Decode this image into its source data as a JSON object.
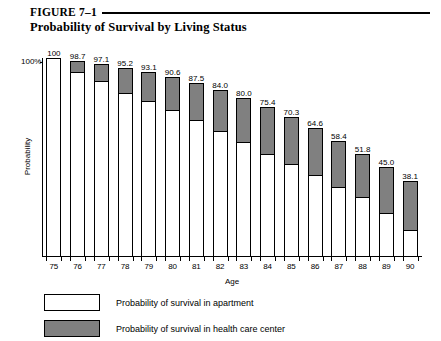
{
  "figure": {
    "number": "FIGURE 7–1",
    "title": "Probability of Survival by Living Status"
  },
  "chart_data": {
    "type": "bar",
    "subtype": "stacked-bar",
    "title": "Probability of Survival by Living Status",
    "xlabel": "Age",
    "ylabel": "Probability",
    "categories": [
      "75",
      "76",
      "77",
      "78",
      "79",
      "80",
      "81",
      "82",
      "83",
      "84",
      "85",
      "86",
      "87",
      "88",
      "89",
      "90"
    ],
    "ytick_labels": [
      "100%"
    ],
    "ylim": [
      0,
      100
    ],
    "grid": false,
    "legend_position": "below-plot",
    "totals": [
      100,
      98.7,
      97.1,
      95.2,
      93.1,
      90.6,
      87.5,
      84.0,
      80.0,
      75.4,
      70.3,
      64.6,
      58.4,
      51.8,
      45.0,
      38.1
    ],
    "data_labels": [
      "100",
      "98.7",
      "97.1",
      "95.2",
      "93.1",
      "90.6",
      "87.5",
      "84.0",
      "80.0",
      "75.4",
      "70.3",
      "64.6",
      "58.4",
      "51.8",
      "45.0",
      "38.1"
    ],
    "series": [
      {
        "name": "Probability of survival in apartment",
        "color": "#ffffff",
        "values": [
          100.0,
          93.2,
          89.0,
          83.0,
          78.5,
          74.0,
          69.0,
          63.5,
          58.0,
          52.0,
          47.0,
          41.5,
          35.5,
          30.0,
          22.0,
          13.5
        ]
      },
      {
        "name": "Probability of survival in health care center",
        "color": "#808080",
        "values": [
          0.0,
          5.5,
          8.1,
          12.2,
          14.6,
          16.6,
          18.5,
          20.5,
          22.0,
          23.4,
          23.3,
          23.1,
          22.9,
          21.8,
          23.0,
          24.6
        ]
      }
    ]
  },
  "legend": {
    "items": [
      {
        "swatch": "white",
        "label": "Probability of survival in apartment"
      },
      {
        "swatch": "gray",
        "label": "Probability of survival in health care center"
      }
    ]
  },
  "axes": {
    "y_tick_label": "100%",
    "y_axis_title": "Probability",
    "x_axis_title": "Age"
  }
}
